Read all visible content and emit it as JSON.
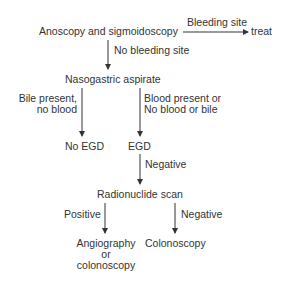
{
  "diagram": {
    "type": "flowchart",
    "text_color": "#333333",
    "line_color": "#333333",
    "nodes": {
      "anoscopy": "Anoscopy and sigmoidoscopy",
      "treat": "treat",
      "nasogastric": "Nasogastric aspirate",
      "no_egd": "No EGD",
      "egd": "EGD",
      "radionuclide": "Radionuclide scan",
      "angio_line1": "Angiography",
      "angio_line2": "or",
      "angio_line3": "colonoscopy",
      "colonoscopy": "Colonoscopy"
    },
    "edges": {
      "bleeding_site": "Bleeding site",
      "no_bleeding_site": "No bleeding site",
      "bile_line1": "Bile present,",
      "bile_line2": "no blood",
      "blood_line1": "Blood present or",
      "blood_line2": "No blood or bile",
      "egd_negative": "Negative",
      "positive": "Positive",
      "scan_negative": "Negative"
    }
  }
}
